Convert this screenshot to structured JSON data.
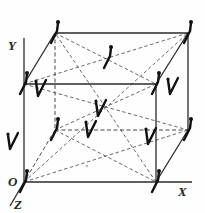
{
  "figure": {
    "colors": {
      "line": "#2a2a2a",
      "dipole": "#111111",
      "background": "#fefefe"
    }
  },
  "axes": {
    "x_label": "X",
    "y_label": "Y",
    "z_label": "Z",
    "origin_label": "O"
  },
  "cube": {
    "front_bottom_left": [
      24,
      182
    ],
    "front_bottom_right": [
      156,
      182
    ],
    "front_top_left": [
      24,
      84
    ],
    "front_top_right": [
      156,
      84
    ],
    "back_bottom_left": [
      55,
      130
    ],
    "back_bottom_right": [
      188,
      130
    ],
    "back_top_left": [
      55,
      33
    ],
    "back_top_right": [
      188,
      33
    ],
    "center": [
      106,
      107
    ]
  },
  "dipoles": [
    {
      "name": "corner-back-top-left",
      "type": "J",
      "x": 55,
      "y": 33
    },
    {
      "name": "corner-back-top-right",
      "type": "J",
      "x": 188,
      "y": 33
    },
    {
      "name": "corner-front-top-left",
      "type": "J",
      "x": 24,
      "y": 84
    },
    {
      "name": "corner-front-top-right",
      "type": "J",
      "x": 156,
      "y": 84
    },
    {
      "name": "corner-back-bottom-left",
      "type": "J",
      "x": 55,
      "y": 130
    },
    {
      "name": "corner-back-bottom-right",
      "type": "J",
      "x": 188,
      "y": 130
    },
    {
      "name": "corner-origin",
      "type": "J",
      "x": 24,
      "y": 182
    },
    {
      "name": "corner-front-bottom-right",
      "type": "J",
      "x": 156,
      "y": 182
    },
    {
      "name": "face-top",
      "type": "J",
      "x": 108,
      "y": 58
    },
    {
      "name": "face-front",
      "type": "V",
      "x": 90,
      "y": 133
    },
    {
      "name": "face-left",
      "type": "V",
      "x": 40,
      "y": 92
    },
    {
      "name": "face-right",
      "type": "V",
      "x": 172,
      "y": 90
    },
    {
      "name": "face-back",
      "type": "V",
      "x": 150,
      "y": 140
    },
    {
      "name": "face-bottom",
      "type": "V",
      "x": 12,
      "y": 145
    },
    {
      "name": "body-center",
      "type": "V",
      "x": 100,
      "y": 112
    }
  ]
}
